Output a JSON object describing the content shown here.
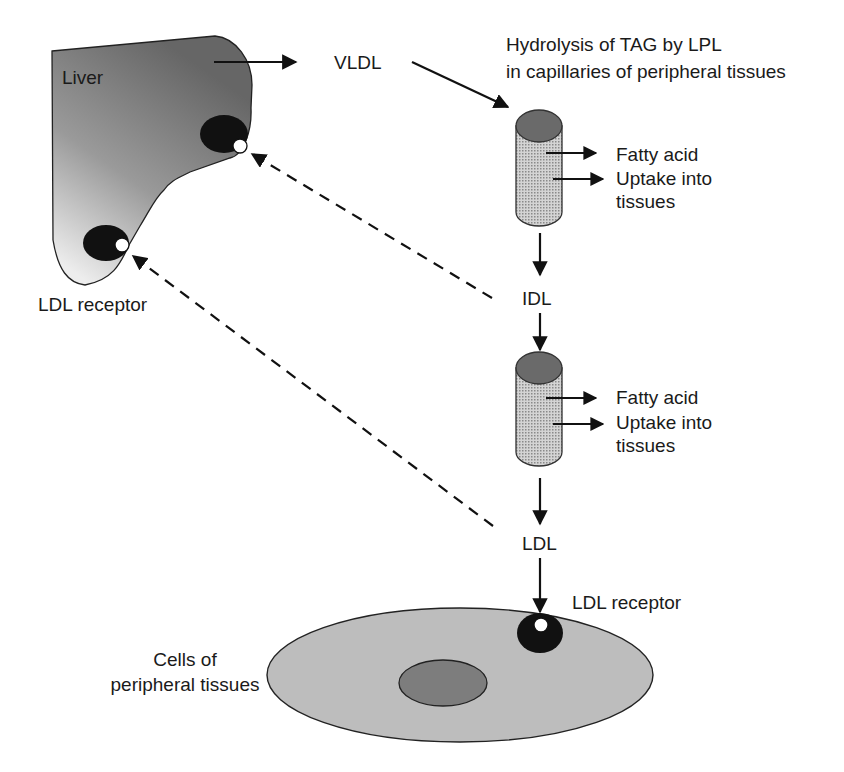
{
  "diagram": {
    "type": "lipoprotein-metabolism-flow",
    "colors": {
      "liver_fill_dark": "#6e6e6e",
      "liver_fill_light": "#e6e6e6",
      "receptor": "#111111",
      "capillary_top": "#6a6a6a",
      "capillary_body": "#c8c8c8",
      "cell_fill": "#bdbdbd",
      "nucleus_fill": "#7d7d7d",
      "line": "#111111"
    },
    "nodes": {
      "liver": {
        "label": "Liver"
      },
      "liver_receptor": {
        "label": "LDL receptor"
      },
      "vldl": {
        "label": "VLDL"
      },
      "hydrolysis": {
        "line1": "Hydrolysis of TAG by LPL",
        "line2": "in capillaries of peripheral tissues"
      },
      "capillary1": {
        "fatty_acid": "Fatty acid",
        "uptake_line1": "Uptake into",
        "uptake_line2": "tissues"
      },
      "idl": {
        "label": "IDL"
      },
      "capillary2": {
        "fatty_acid": "Fatty acid",
        "uptake_line1": "Uptake into",
        "uptake_line2": "tissues"
      },
      "ldl": {
        "label": "LDL"
      },
      "peripheral_receptor": {
        "label": "LDL receptor"
      },
      "peripheral_cells": {
        "line1": "Cells of",
        "line2": "peripheral tissues"
      }
    },
    "edges": [
      {
        "from": "liver",
        "to": "vldl",
        "style": "solid"
      },
      {
        "from": "vldl",
        "to": "capillary1",
        "style": "solid"
      },
      {
        "from": "capillary1",
        "to": "fatty_acid_uptake",
        "style": "solid"
      },
      {
        "from": "capillary1",
        "to": "idl",
        "style": "solid"
      },
      {
        "from": "idl",
        "to": "liver_receptor_upper",
        "style": "dashed"
      },
      {
        "from": "idl",
        "to": "capillary2",
        "style": "solid"
      },
      {
        "from": "capillary2",
        "to": "fatty_acid_uptake",
        "style": "solid"
      },
      {
        "from": "capillary2",
        "to": "ldl",
        "style": "solid"
      },
      {
        "from": "ldl",
        "to": "liver_receptor_lower",
        "style": "dashed"
      },
      {
        "from": "ldl",
        "to": "peripheral_receptor",
        "style": "solid"
      }
    ]
  }
}
